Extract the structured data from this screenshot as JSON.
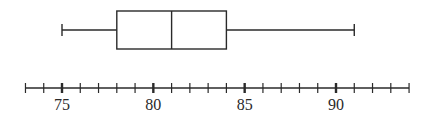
{
  "chart_data": {
    "type": "boxplot",
    "title": "",
    "xlabel": "",
    "ylabel": "",
    "orientation": "horizontal",
    "boxplot": {
      "min": 75,
      "q1": 78,
      "median": 81,
      "q3": 84,
      "max": 91
    },
    "axis": {
      "range": [
        73,
        94
      ],
      "minor_tick_step": 1,
      "major_ticks": [
        75,
        80,
        85,
        90
      ],
      "tick_labels": [
        "75",
        "80",
        "85",
        "90"
      ]
    },
    "grid": false,
    "legend": null
  },
  "colors": {
    "line": "#2a2a2a",
    "background": "#ffffff"
  }
}
